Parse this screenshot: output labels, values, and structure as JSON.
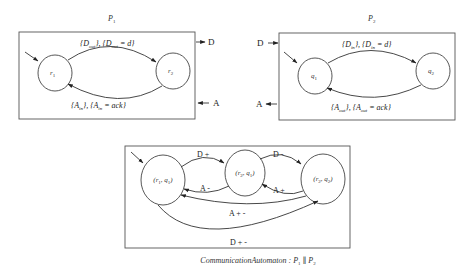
{
  "diagrams": {
    "p1": {
      "title": "P₁",
      "states": [
        {
          "id": "r1",
          "label": "r₁"
        },
        {
          "id": "r2",
          "label": "r₂"
        }
      ],
      "transitions": [
        {
          "from": "r1",
          "to": "r2",
          "label": "{D_out}, {D_out = d}"
        },
        {
          "from": "r2",
          "to": "r1",
          "label": "{A_in}, {A_in = ack}"
        }
      ],
      "external": [
        {
          "label": "D",
          "direction": "out"
        },
        {
          "label": "A",
          "direction": "in"
        }
      ]
    },
    "p2": {
      "title": "P₂",
      "states": [
        {
          "id": "q1",
          "label": "q₁"
        },
        {
          "id": "q2",
          "label": "q₂"
        }
      ],
      "transitions": [
        {
          "from": "q1",
          "to": "q2",
          "label": "{D_in}, {D_in = d}"
        },
        {
          "from": "q2",
          "to": "q1",
          "label": "{A_out}, {A_out = ack}"
        }
      ],
      "external": [
        {
          "label": "D",
          "direction": "in"
        },
        {
          "label": "A",
          "direction": "out"
        }
      ]
    },
    "composite": {
      "caption": "CommunicationAutomaton : P₁ ∥ P₂",
      "states": [
        {
          "id": "r1q1",
          "label": "(r₁, q₁)"
        },
        {
          "id": "r2q1",
          "label": "(r₂, q₁)"
        },
        {
          "id": "r2q2",
          "label": "(r₂, q₂)"
        }
      ],
      "transitions": [
        {
          "from": "r1q1",
          "to": "r2q1",
          "label": "D +"
        },
        {
          "from": "r2q1",
          "to": "r1q1",
          "label": "A -"
        },
        {
          "from": "r2q1",
          "to": "r2q2",
          "label": "D -"
        },
        {
          "from": "r2q2",
          "to": "r2q1",
          "label": "A +"
        },
        {
          "from": "r2q2",
          "to": "r1q1",
          "label": "A + -"
        },
        {
          "from": "r1q1",
          "to": "r2q2",
          "label": "D + -"
        }
      ]
    }
  }
}
